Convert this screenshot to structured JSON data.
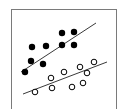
{
  "chart_data": {
    "type": "scatter",
    "title": "",
    "xlabel": "",
    "ylabel": "",
    "grid": false,
    "legend": null,
    "frame": {
      "x": 11,
      "y": 9,
      "width": 105,
      "height": 101,
      "stroke": "#7a7a7a"
    },
    "series": [
      {
        "name": "filled",
        "marker": "filled-circle",
        "color": "#000000",
        "points": [
          {
            "x": 25,
            "y": 72
          },
          {
            "x": 31,
            "y": 61
          },
          {
            "x": 32,
            "y": 47
          },
          {
            "x": 43,
            "y": 64
          },
          {
            "x": 46,
            "y": 46
          },
          {
            "x": 62,
            "y": 33
          },
          {
            "x": 62,
            "y": 45
          },
          {
            "x": 74,
            "y": 32
          },
          {
            "x": 74,
            "y": 45
          }
        ],
        "trendline": {
          "x1": 21,
          "y1": 72,
          "x2": 96,
          "y2": 23
        }
      },
      {
        "name": "open",
        "marker": "open-circle",
        "color": "#000000",
        "points": [
          {
            "x": 35,
            "y": 92
          },
          {
            "x": 51,
            "y": 78
          },
          {
            "x": 52,
            "y": 88
          },
          {
            "x": 64,
            "y": 72
          },
          {
            "x": 72,
            "y": 87
          },
          {
            "x": 80,
            "y": 67
          },
          {
            "x": 83,
            "y": 83
          },
          {
            "x": 87,
            "y": 73
          },
          {
            "x": 94,
            "y": 62
          }
        ],
        "trendline": {
          "x1": 23,
          "y1": 94,
          "x2": 107,
          "y2": 62
        }
      }
    ]
  }
}
